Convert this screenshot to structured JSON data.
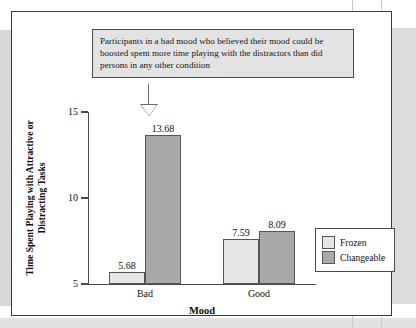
{
  "annotation": {
    "text": "Participants in a bad mood who believed their mood could be boosted spent more time playing with the distractors than did persons in any other condition"
  },
  "chart_data": {
    "type": "bar",
    "title": "",
    "xlabel": "Mood",
    "ylabel": "Time Spent Playing with Attractive or Distracting Tasks",
    "ylabel_line1": "Time Spent Playing with Attractive or",
    "ylabel_line2": "Distracting Tasks",
    "categories": [
      "Bad",
      "Good"
    ],
    "ylim": [
      5,
      15
    ],
    "yticks": [
      5,
      10,
      15
    ],
    "ytick_labels": [
      "5",
      "10",
      "15"
    ],
    "grid": false,
    "legend_position": "bottom-right",
    "series": [
      {
        "name": "Frozen",
        "color": "#e6e6e6",
        "values": [
          5.68,
          7.59
        ],
        "labels": [
          "5.68",
          "7.59"
        ]
      },
      {
        "name": "Changeable",
        "color": "#a9a9a9",
        "values": [
          13.68,
          8.09
        ],
        "labels": [
          "13.68",
          "8.09"
        ]
      }
    ],
    "annotation_target": "Bad / Changeable"
  },
  "legend": {
    "items": [
      {
        "label": "Frozen",
        "swatch": "frozen"
      },
      {
        "label": "Changeable",
        "swatch": "changeable"
      }
    ]
  }
}
